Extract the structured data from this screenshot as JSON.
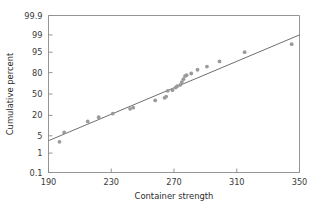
{
  "chart_data": {
    "type": "scatter",
    "title": "",
    "subtitle": "",
    "xlabel": "Container strength",
    "ylabel": "Cumulative percent",
    "grid": false,
    "legend": "none",
    "yscale": "normal-probability",
    "xlim": [
      190,
      350
    ],
    "ylim": [
      0.1,
      99.9
    ],
    "xticks": [
      190,
      230,
      270,
      310,
      350
    ],
    "xtick_labels": [
      "190",
      "230",
      "270",
      "310",
      "350"
    ],
    "yticks": [
      0.1,
      1,
      5,
      20,
      50,
      80,
      95,
      99,
      99.9
    ],
    "ytick_labels": [
      "0.1",
      "1",
      "5",
      "20",
      "50",
      "80",
      "95",
      "99",
      "99.9"
    ],
    "x": [
      197,
      200,
      215,
      222,
      231,
      242,
      244,
      258,
      264,
      265,
      266,
      269,
      271,
      272,
      274,
      275,
      276,
      277,
      278,
      281,
      285,
      291,
      299,
      315,
      345
    ],
    "y": [
      3.0,
      6.5,
      14.0,
      18.0,
      22.0,
      28.0,
      29.5,
      40.0,
      44.0,
      46.0,
      55.0,
      56.0,
      60.0,
      62.0,
      64.0,
      68.0,
      72.0,
      76.0,
      77.0,
      79.0,
      83.0,
      86.0,
      90.0,
      95.0,
      97.5
    ],
    "series": [
      {
        "name": "Container strength sample",
        "point_color": "#9a9a9a",
        "points": [
          {
            "x": 197,
            "y": 3.0
          },
          {
            "x": 200,
            "y": 6.5
          },
          {
            "x": 215,
            "y": 14.0
          },
          {
            "x": 222,
            "y": 18.0
          },
          {
            "x": 231,
            "y": 22.0
          },
          {
            "x": 242,
            "y": 28.0
          },
          {
            "x": 244,
            "y": 29.5
          },
          {
            "x": 258,
            "y": 40.0
          },
          {
            "x": 264,
            "y": 44.0
          },
          {
            "x": 265,
            "y": 46.0
          },
          {
            "x": 266,
            "y": 55.0
          },
          {
            "x": 269,
            "y": 56.0
          },
          {
            "x": 271,
            "y": 60.0
          },
          {
            "x": 272,
            "y": 62.0
          },
          {
            "x": 274,
            "y": 64.0
          },
          {
            "x": 275,
            "y": 68.0
          },
          {
            "x": 276,
            "y": 72.0
          },
          {
            "x": 277,
            "y": 76.0
          },
          {
            "x": 278,
            "y": 77.0
          },
          {
            "x": 281,
            "y": 79.0
          },
          {
            "x": 285,
            "y": 83.0
          },
          {
            "x": 291,
            "y": 86.0
          },
          {
            "x": 299,
            "y": 90.0
          },
          {
            "x": 315,
            "y": 95.0
          },
          {
            "x": 345,
            "y": 97.5
          }
        ]
      }
    ],
    "fit_line": {
      "name": "normal probability reference line",
      "color": "#6f6f6f",
      "x_start": 190,
      "y_start": 3.3,
      "x_end": 350,
      "y_end": 99.0
    },
    "colors": {
      "point": "#9a9a9a",
      "line": "#6f6f6f",
      "axis": "#8a8a8a",
      "text": "#2b2b2b",
      "background": "#ffffff"
    }
  }
}
